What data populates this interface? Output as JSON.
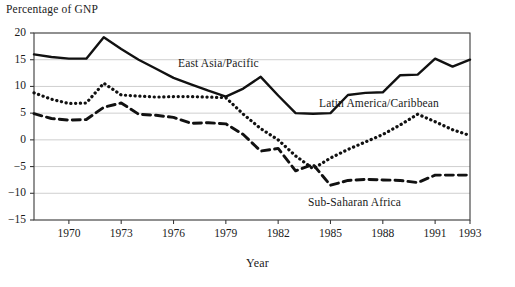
{
  "chart_data": {
    "type": "line",
    "title": "",
    "ylabel": "Percentage of GNP",
    "xlabel": "Year",
    "ylim": [
      -15,
      20
    ],
    "xlim": [
      1968,
      1993
    ],
    "yticks": [
      20,
      15,
      10,
      5,
      0,
      -5,
      -10,
      -15
    ],
    "ytick_labels": [
      "20",
      "15",
      "10",
      "5",
      "0",
      "−5",
      "−10",
      "−15"
    ],
    "xticks": [
      1970,
      1973,
      1976,
      1979,
      1982,
      1985,
      1988,
      1991,
      1993
    ],
    "xtick_labels": [
      "1970",
      "1973",
      "1976",
      "1979",
      "1982",
      "1985",
      "1988",
      "1991",
      "1993"
    ],
    "grid": "horizontal",
    "legend": "inline-annotations",
    "x": [
      1968,
      1969,
      1970,
      1971,
      1972,
      1973,
      1974,
      1975,
      1976,
      1977,
      1978,
      1979,
      1980,
      1981,
      1982,
      1983,
      1984,
      1985,
      1986,
      1987,
      1988,
      1989,
      1990,
      1991,
      1992,
      1993
    ],
    "series": [
      {
        "name": "East Asia/Pacific",
        "style": "solid",
        "color": "#111111",
        "label_x": 178,
        "label_y": 57,
        "values": [
          16.0,
          15.5,
          15.2,
          15.2,
          19.2,
          17.0,
          15.0,
          13.3,
          11.6,
          10.4,
          9.2,
          8.1,
          9.6,
          11.8,
          8.3,
          5.0,
          4.9,
          5.0,
          8.4,
          8.8,
          8.9,
          12.1,
          12.2,
          15.2,
          13.7,
          15.0
        ]
      },
      {
        "name": "Latin America/Caribbean",
        "style": "dotted",
        "color": "#111111",
        "label_x": 319,
        "label_y": 97,
        "values": [
          8.8,
          7.6,
          6.8,
          6.9,
          10.6,
          8.4,
          8.2,
          8.0,
          8.1,
          8.1,
          8.0,
          7.9,
          4.8,
          2.1,
          0.0,
          -3.0,
          -5.4,
          -3.4,
          -1.8,
          -0.4,
          1.0,
          2.8,
          4.8,
          3.4,
          1.9,
          0.8
        ]
      },
      {
        "name": "Sub-Saharan Africa",
        "style": "dashed",
        "color": "#111111",
        "label_x": 308,
        "label_y": 196,
        "values": [
          4.9,
          4.0,
          3.7,
          3.8,
          6.1,
          6.9,
          4.8,
          4.6,
          4.2,
          3.1,
          3.2,
          3.0,
          1.0,
          -2.1,
          -1.6,
          -5.8,
          -4.6,
          -8.5,
          -7.6,
          -7.4,
          -7.5,
          -7.6,
          -8.0,
          -6.6,
          -6.6,
          -6.6
        ]
      }
    ]
  }
}
